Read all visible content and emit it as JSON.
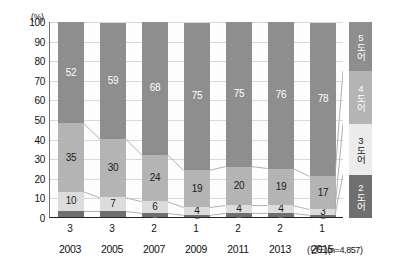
{
  "chart_data": {
    "type": "bar",
    "variant": "stacked-100-percent",
    "title": "",
    "xlabel": "(년도)",
    "ylabel": "(%)",
    "ylim": [
      0,
      100
    ],
    "ytick_step": 10,
    "yticks": [
      "100",
      "90",
      "80",
      "70",
      "60",
      "50",
      "40",
      "30",
      "20",
      "10",
      "0"
    ],
    "y_unit_label": "(%)",
    "grid": true,
    "legend_position": "right-outside-vertical",
    "sample_note": "(n=4,857)",
    "categories": [
      "2003",
      "2005",
      "2007",
      "2009",
      "2011",
      "2013",
      "2015"
    ],
    "series": [
      {
        "name": "2도어",
        "color": "#6f6f6f",
        "values": [
          3,
          3,
          2,
          1,
          2,
          2,
          1
        ]
      },
      {
        "name": "3도어",
        "color": "#dcdcdc",
        "values": [
          10,
          7,
          6,
          4,
          4,
          4,
          3
        ]
      },
      {
        "name": "4도어",
        "color": "#b4b4b4",
        "values": [
          35,
          30,
          24,
          19,
          20,
          19,
          17
        ]
      },
      {
        "name": "5도어",
        "color": "#8e8e8e",
        "values": [
          52,
          59,
          68,
          75,
          75,
          76,
          78
        ]
      }
    ],
    "legend_entries": [
      "5도어",
      "4도어",
      "3도어",
      "2도어"
    ],
    "axis_note_full": "(년도)(n=4,857)"
  }
}
